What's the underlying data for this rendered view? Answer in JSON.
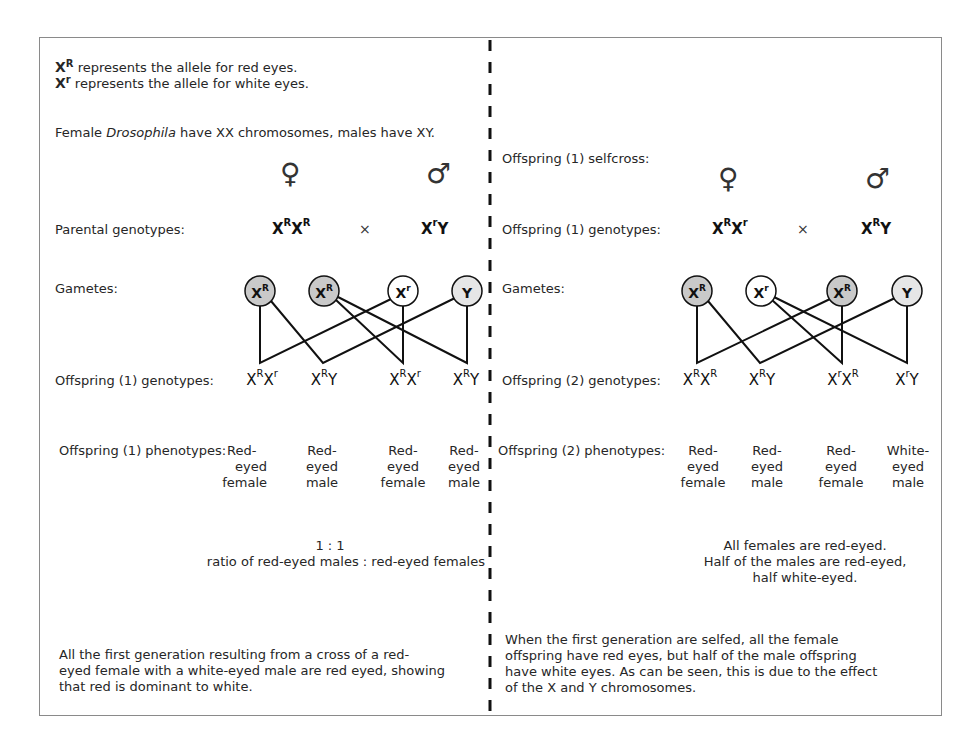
{
  "legend": {
    "line1_symbol": "X",
    "line1_sup": "R",
    "line1_text": " represents the allele for red eyes.",
    "line2_symbol": "X",
    "line2_sup": "r",
    "line2_text": " represents the allele for white eyes."
  },
  "intro": {
    "pre": "Female ",
    "italic": "Drosophila",
    "post": " have XX chromosomes, males have XY."
  },
  "symbols": {
    "female": "♀",
    "male": "♂",
    "cross": "×"
  },
  "left": {
    "parental_label": "Parental genotypes:",
    "parental_female": {
      "base": "X",
      "sup": "R",
      "base2": "X",
      "sup2": "R"
    },
    "parental_male": {
      "base": "X",
      "sup": "r",
      "base2": "Y"
    },
    "gametes_label": "Gametes:",
    "gametes": [
      {
        "base": "X",
        "sup": "R",
        "fill": "#c9c9c9"
      },
      {
        "base": "X",
        "sup": "R",
        "fill": "#c9c9c9"
      },
      {
        "base": "X",
        "sup": "r",
        "fill": "#ffffff"
      },
      {
        "base": "Y",
        "sup": "",
        "fill": "#e6e6e6"
      }
    ],
    "offspring_genotypes_label": "Offspring (1) genotypes:",
    "offspring_genotypes": [
      {
        "a": "X",
        "as": "R",
        "b": "X",
        "bs": "r"
      },
      {
        "a": "X",
        "as": "R",
        "b": "Y",
        "bs": ""
      },
      {
        "a": "X",
        "as": "R",
        "b": "X",
        "bs": "r"
      },
      {
        "a": "X",
        "as": "R",
        "b": "Y",
        "bs": ""
      }
    ],
    "offspring_phenotypes_label": "Offspring (1) phenotypes:",
    "offspring_phenotypes": [
      {
        "l1": "Red-",
        "l2": "eyed",
        "l3": "female"
      },
      {
        "l1": "Red-",
        "l2": "eyed",
        "l3": "male"
      },
      {
        "l1": "Red-",
        "l2": "eyed",
        "l3": "female"
      },
      {
        "l1": "Red-",
        "l2": "eyed",
        "l3": "male"
      }
    ],
    "ratio_line1": "1 : 1",
    "ratio_line2": "ratio of red-eyed males : red-eyed females",
    "summary": [
      "All the first generation resulting from a cross of a red-",
      "eyed female with a white-eyed male are red eyed, showing",
      "that red is dominant to white."
    ]
  },
  "right": {
    "selfcross_label": "Offspring (1) selfcross:",
    "parental_label": "Offspring (1) genotypes:",
    "parental_female": {
      "base": "X",
      "sup": "R",
      "base2": "X",
      "sup2": "r"
    },
    "parental_male": {
      "base": "X",
      "sup": "R",
      "base2": "Y"
    },
    "gametes_label": "Gametes:",
    "gametes": [
      {
        "base": "X",
        "sup": "R",
        "fill": "#c9c9c9"
      },
      {
        "base": "X",
        "sup": "r",
        "fill": "#ffffff"
      },
      {
        "base": "X",
        "sup": "R",
        "fill": "#c9c9c9"
      },
      {
        "base": "Y",
        "sup": "",
        "fill": "#e6e6e6"
      }
    ],
    "offspring_genotypes_label": "Offspring (2) genotypes:",
    "offspring_genotypes": [
      {
        "a": "X",
        "as": "R",
        "b": "X",
        "bs": "R"
      },
      {
        "a": "X",
        "as": "R",
        "b": "Y",
        "bs": ""
      },
      {
        "a": "X",
        "as": "r",
        "b": "X",
        "bs": "R"
      },
      {
        "a": "X",
        "as": "r",
        "b": "Y",
        "bs": ""
      }
    ],
    "offspring_phenotypes_label": "Offspring (2) phenotypes:",
    "offspring_phenotypes": [
      {
        "l1": "Red-",
        "l2": "eyed",
        "l3": "female"
      },
      {
        "l1": "Red-",
        "l2": "eyed",
        "l3": "male"
      },
      {
        "l1": "Red-",
        "l2": "eyed",
        "l3": "female"
      },
      {
        "l1": "White-",
        "l2": "eyed",
        "l3": "male"
      }
    ],
    "conclusion": [
      "All females are red-eyed.",
      "Half of the males are red-eyed,",
      "half white-eyed."
    ],
    "summary": [
      "When the first generation are selfed, all the female",
      "offspring have red eyes, but half of the male offspring",
      "have white eyes.  As can be seen, this is due to the effect",
      "of the X and Y chromosomes."
    ]
  },
  "colors": {
    "frame": "#8a8a8a",
    "line": "#111111",
    "xR_fill": "#c9c9c9",
    "xr_fill": "#ffffff",
    "y_fill": "#e6e6e6"
  }
}
